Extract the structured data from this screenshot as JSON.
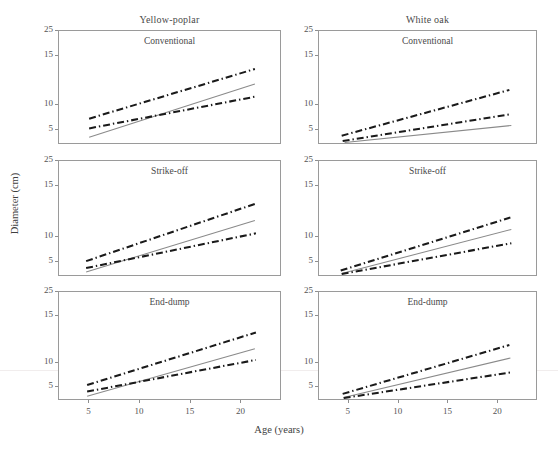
{
  "figure": {
    "width": 558,
    "height": 449,
    "background": "#ffffff",
    "axis_color": "#9a9a9a",
    "fit_line_color": "#8a8a8a",
    "bound_line_color": "#1a1a1a"
  },
  "axes": {
    "ylabel": "Diameter (cm)",
    "xlabel": "Age (years)",
    "ytick_labels": [
      "25",
      "15",
      "10",
      "5"
    ],
    "ytick_values": [
      25,
      20,
      10,
      5
    ],
    "xtick_labels": [
      "5",
      "10",
      "15",
      "20"
    ],
    "xtick_values": [
      5,
      10,
      15,
      20
    ],
    "xlim": [
      2,
      24
    ],
    "ylim": [
      2,
      25
    ],
    "grid": "off",
    "legend": "none"
  },
  "columns": [
    {
      "id": "yellow-poplar",
      "label": "Yellow-poplar"
    },
    {
      "id": "white-oak",
      "label": "White oak"
    }
  ],
  "rows": [
    {
      "id": "conventional",
      "label": "Conventional"
    },
    {
      "id": "strike-off",
      "label": "Strike-off"
    },
    {
      "id": "end-dump",
      "label": "End-dump"
    }
  ],
  "chart_data": {
    "type": "line",
    "title": "",
    "xlabel": "Age (years)",
    "ylabel": "Diameter (cm)",
    "xlim": [
      2,
      24
    ],
    "ylim": [
      2,
      25
    ],
    "grid": false,
    "legend_position": "none",
    "layout": {
      "rows": 3,
      "cols": 2
    },
    "panels": [
      {
        "row": 0,
        "col": 0,
        "species": "Yellow-poplar",
        "treatment": "Conventional",
        "series": [
          {
            "name": "upper-bound",
            "style": "dash-dot",
            "color": "#1a1a1a",
            "x": [
              5.0,
              21.5
            ],
            "y": [
              7.0,
              17.2
            ]
          },
          {
            "name": "fitted",
            "style": "solid",
            "color": "#8a8a8a",
            "x": [
              5.0,
              21.5
            ],
            "y": [
              3.2,
              14.1
            ]
          },
          {
            "name": "lower-bound",
            "style": "dash-dot",
            "color": "#1a1a1a",
            "x": [
              5.0,
              21.5
            ],
            "y": [
              5.0,
              11.5
            ]
          }
        ]
      },
      {
        "row": 0,
        "col": 1,
        "species": "White oak",
        "treatment": "Conventional",
        "series": [
          {
            "name": "upper-bound",
            "style": "dash-dot",
            "color": "#1a1a1a",
            "x": [
              4.3,
              21.3
            ],
            "y": [
              3.5,
              12.9
            ]
          },
          {
            "name": "fitted",
            "style": "solid",
            "color": "#8a8a8a",
            "x": [
              4.6,
              21.5
            ],
            "y": [
              2.1,
              5.6
            ]
          },
          {
            "name": "lower-bound",
            "style": "dash-dot",
            "color": "#1a1a1a",
            "x": [
              4.4,
              21.4
            ],
            "y": [
              2.4,
              7.9
            ]
          }
        ]
      },
      {
        "row": 1,
        "col": 0,
        "species": "Yellow-poplar",
        "treatment": "Strike-off",
        "series": [
          {
            "name": "upper-bound",
            "style": "dash-dot",
            "color": "#1a1a1a",
            "x": [
              4.7,
              21.6
            ],
            "y": [
              4.8,
              16.4
            ]
          },
          {
            "name": "fitted",
            "style": "solid",
            "color": "#8a8a8a",
            "x": [
              4.7,
              21.5
            ],
            "y": [
              2.6,
              13.0
            ]
          },
          {
            "name": "lower-bound",
            "style": "dash-dot",
            "color": "#1a1a1a",
            "x": [
              4.7,
              21.6
            ],
            "y": [
              3.4,
              10.4
            ]
          }
        ]
      },
      {
        "row": 1,
        "col": 1,
        "species": "White oak",
        "treatment": "Strike-off",
        "series": [
          {
            "name": "upper-bound",
            "style": "dash-dot",
            "color": "#1a1a1a",
            "x": [
              4.2,
              21.4
            ],
            "y": [
              2.9,
              13.6
            ]
          },
          {
            "name": "fitted",
            "style": "solid",
            "color": "#8a8a8a",
            "x": [
              4.3,
              21.5
            ],
            "y": [
              2.3,
              11.2
            ]
          },
          {
            "name": "lower-bound",
            "style": "dash-dot",
            "color": "#1a1a1a",
            "x": [
              4.3,
              21.5
            ],
            "y": [
              2.2,
              8.4
            ]
          }
        ]
      },
      {
        "row": 2,
        "col": 0,
        "species": "Yellow-poplar",
        "treatment": "End-dump",
        "series": [
          {
            "name": "upper-bound",
            "style": "dash-dot",
            "color": "#1a1a1a",
            "x": [
              4.8,
              21.6
            ],
            "y": [
              5.0,
              16.3
            ]
          },
          {
            "name": "fitted",
            "style": "solid",
            "color": "#8a8a8a",
            "x": [
              4.8,
              21.5
            ],
            "y": [
              2.6,
              12.8
            ]
          },
          {
            "name": "lower-bound",
            "style": "dash-dot",
            "color": "#1a1a1a",
            "x": [
              4.8,
              21.6
            ],
            "y": [
              3.6,
              10.4
            ]
          }
        ]
      },
      {
        "row": 2,
        "col": 1,
        "species": "White oak",
        "treatment": "End-dump",
        "series": [
          {
            "name": "upper-bound",
            "style": "dash-dot",
            "color": "#1a1a1a",
            "x": [
              4.4,
              21.3
            ],
            "y": [
              3.1,
              13.6
            ]
          },
          {
            "name": "fitted",
            "style": "solid",
            "color": "#8a8a8a",
            "x": [
              4.5,
              21.4
            ],
            "y": [
              2.3,
              10.8
            ]
          },
          {
            "name": "lower-bound",
            "style": "dash-dot",
            "color": "#1a1a1a",
            "x": [
              4.5,
              21.4
            ],
            "y": [
              2.2,
              7.7
            ]
          }
        ]
      }
    ]
  }
}
